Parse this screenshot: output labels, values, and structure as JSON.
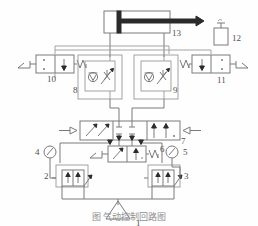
{
  "figure": {
    "type": "pneumatic-circuit-diagram",
    "caption": "图     气动控制回路图",
    "background_color": "#fefefe",
    "line_color": "#6e6e6e",
    "label_color": "#4f4f4f"
  },
  "labels": {
    "item1": "1",
    "item2": "2",
    "item3": "3",
    "item4": "4",
    "item5": "5",
    "item6": "6",
    "item7": "7",
    "item8": "8",
    "item9": "9",
    "item10": "10",
    "item11": "11",
    "item12": "12",
    "item13": "13"
  },
  "components": [
    {
      "id": "1",
      "name": "air-compressor-source",
      "symbol": "triangle-source"
    },
    {
      "id": "2",
      "name": "pressure-regulator-left",
      "symbol": "adjustable-pressure-valve"
    },
    {
      "id": "3",
      "name": "pressure-regulator-right",
      "symbol": "adjustable-pressure-valve"
    },
    {
      "id": "4",
      "name": "pressure-gauge-left",
      "symbol": "gauge-circle"
    },
    {
      "id": "5",
      "name": "pressure-gauge-right",
      "symbol": "gauge-circle"
    },
    {
      "id": "6",
      "name": "manual-lever-valve",
      "symbol": "2-position-lever-spring-valve"
    },
    {
      "id": "7",
      "name": "main-directional-control-valve",
      "symbol": "3-position-pilot-valve"
    },
    {
      "id": "8",
      "name": "one-way-flow-control-valve-left",
      "symbol": "check-valve-with-throttle"
    },
    {
      "id": "9",
      "name": "one-way-flow-control-valve-right",
      "symbol": "check-valve-with-throttle"
    },
    {
      "id": "10",
      "name": "roller-limit-valve-left",
      "symbol": "2-position-roller-spring-valve"
    },
    {
      "id": "11",
      "name": "roller-limit-valve-right",
      "symbol": "2-position-roller-spring-valve"
    },
    {
      "id": "12",
      "name": "lubricator-reservoir",
      "symbol": "small-tank"
    },
    {
      "id": "13",
      "name": "double-acting-cylinder",
      "symbol": "cylinder-with-piston-rod"
    }
  ]
}
